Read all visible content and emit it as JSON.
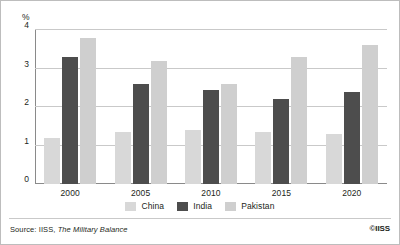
{
  "chart_data": {
    "type": "bar",
    "title": "",
    "subtitle": "",
    "xlabel": "",
    "ylabel": "%",
    "categories": [
      "2000",
      "2005",
      "2010",
      "2015",
      "2020"
    ],
    "series": [
      {
        "name": "China",
        "color": "#d8d8d8",
        "values": [
          1.2,
          1.35,
          1.4,
          1.35,
          1.3
        ]
      },
      {
        "name": "India",
        "color": "#4d4d4d",
        "values": [
          3.3,
          2.6,
          2.45,
          2.2,
          2.4
        ]
      },
      {
        "name": "Pakistan",
        "color": "#cfcfcf",
        "values": [
          3.8,
          3.2,
          2.6,
          3.3,
          3.6
        ]
      }
    ],
    "ylim": [
      0,
      4
    ],
    "yticks": [
      0,
      1,
      2,
      3,
      4
    ],
    "ytick_labels": [
      "0",
      "1",
      "2",
      "3",
      "4"
    ],
    "grid": true,
    "legend_position": "bottom"
  },
  "axes": {
    "y_unit_label": "%",
    "y_tick_labels": [
      "4",
      "3",
      "2",
      "1",
      "0"
    ],
    "x_tick_labels": [
      "2000",
      "2005",
      "2010",
      "2015",
      "2020"
    ]
  },
  "legend": {
    "items": [
      {
        "label": "China",
        "color": "#d8d8d8"
      },
      {
        "label": "India",
        "color": "#4d4d4d"
      },
      {
        "label": "Pakistan",
        "color": "#cfcfcf"
      }
    ]
  },
  "footer": {
    "source_prefix": "Source: IISS, ",
    "source_publication": "The Military Balance",
    "copyright": "©IISS"
  }
}
